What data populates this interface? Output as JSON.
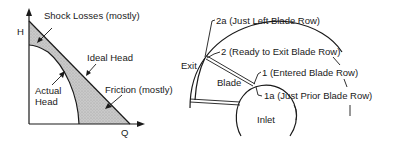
{
  "left_diagram": {
    "axis_y_label": "H",
    "axis_x_label": "Q",
    "labels": {
      "shock_losses": "Shock Losses (mostly)",
      "ideal_head": "Ideal Head",
      "actual_head_line1": "Actual",
      "actual_head_line2": "Head",
      "friction": "Friction (mostly)"
    },
    "colors": {
      "loss_fill": "#c8c8c8",
      "line": "#1a1a1a"
    }
  },
  "right_diagram": {
    "labels": {
      "exit": "Exit",
      "blade": "Blade",
      "inlet": "Inlet",
      "station_2a": "2a (Just Left Blade Row)",
      "station_2": "2 (Ready to Exit Blade Row)",
      "station_1": "1 (Entered Blade Row)",
      "station_1a": "1a (Just Prior Blade Row)"
    }
  }
}
